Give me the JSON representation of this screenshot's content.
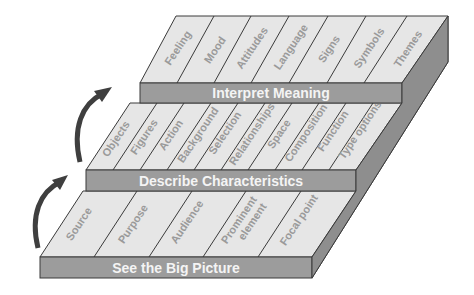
{
  "diagram": {
    "type": "stepped-3d-staircase",
    "colors": {
      "top_surface": "#e6e6e6",
      "front_face": "#9c9c9c",
      "side_face": "#8e8e8e",
      "outline": "#3a3a3a",
      "cell_text": "#9a9a9a",
      "tier_text": "#f4f4f4",
      "arrow": "#3f3f3f"
    },
    "tiers": [
      {
        "level": 1,
        "label": "See the Big Picture",
        "cells": [
          "Source",
          "Purpose",
          "Audience",
          "Prominent element",
          "Focal point"
        ]
      },
      {
        "level": 2,
        "label": "Describe Characteristics",
        "cells": [
          "Objects",
          "Figures",
          "Action",
          "Background",
          "Selection",
          "Relationships",
          "Space",
          "Composition",
          "Function",
          "Type options"
        ]
      },
      {
        "level": 3,
        "label": "Interpret Meaning",
        "cells": [
          "Feeling",
          "Mood",
          "Attitudes",
          "Language",
          "Signs",
          "Symbols",
          "Themes"
        ]
      }
    ],
    "arrows": [
      {
        "from": "See the Big Picture",
        "to": "Describe Characteristics",
        "icon": "curved-up-arrow"
      },
      {
        "from": "Describe Characteristics",
        "to": "Interpret Meaning",
        "icon": "curved-up-arrow"
      }
    ]
  }
}
